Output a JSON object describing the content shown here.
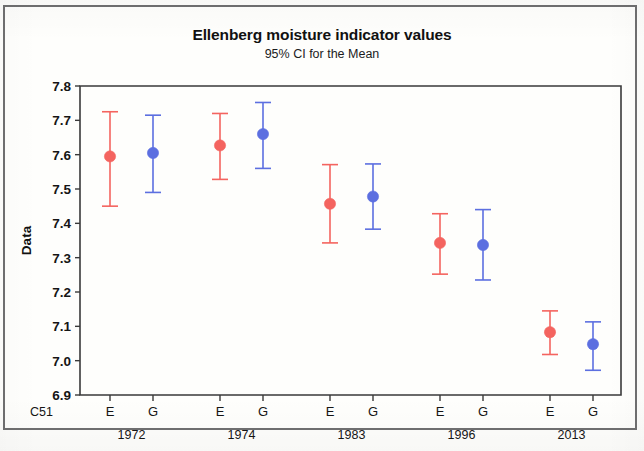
{
  "chart_data": {
    "type": "scatter",
    "title": "Ellenberg moisture indicator values",
    "subtitle": "95% CI for the Mean",
    "ylabel": "Data",
    "xlabel": "",
    "corner_label": "C51",
    "ylim": [
      6.9,
      7.8
    ],
    "ytick_labels": [
      "7.8",
      "7.7",
      "7.6",
      "7.5",
      "7.4",
      "7.3",
      "7.2",
      "7.1",
      "7.0",
      "6.9"
    ],
    "ytick_values": [
      7.8,
      7.7,
      7.6,
      7.5,
      7.4,
      7.3,
      7.2,
      7.1,
      7.0,
      6.9
    ],
    "grid": false,
    "legend": "none",
    "categories": [
      "1972",
      "1974",
      "1983",
      "1996",
      "2013"
    ],
    "subcategories": [
      "E",
      "G"
    ],
    "colors": {
      "E": "#F4645F",
      "G": "#5C6FE0"
    },
    "series": [
      {
        "name": "E",
        "color": "#F4645F",
        "values": [
          7.595,
          7.627,
          7.457,
          7.343,
          7.083
        ],
        "ci_lower": [
          7.45,
          7.528,
          7.343,
          7.252,
          7.018
        ],
        "ci_upper": [
          7.725,
          7.72,
          7.571,
          7.428,
          7.145
        ]
      },
      {
        "name": "G",
        "color": "#5C6FE0",
        "values": [
          7.605,
          7.66,
          7.478,
          7.337,
          7.048
        ],
        "ci_lower": [
          7.49,
          7.56,
          7.383,
          7.235,
          6.972
        ],
        "ci_upper": [
          7.715,
          7.752,
          7.573,
          7.44,
          7.113
        ]
      }
    ],
    "points": [
      {
        "group": "1972",
        "sub": "E",
        "mean": 7.595,
        "lower": 7.45,
        "upper": 7.725,
        "color": "#F4645F"
      },
      {
        "group": "1972",
        "sub": "G",
        "mean": 7.605,
        "lower": 7.49,
        "upper": 7.715,
        "color": "#5C6FE0"
      },
      {
        "group": "1974",
        "sub": "E",
        "mean": 7.627,
        "lower": 7.528,
        "upper": 7.72,
        "color": "#F4645F"
      },
      {
        "group": "1974",
        "sub": "G",
        "mean": 7.66,
        "lower": 7.56,
        "upper": 7.752,
        "color": "#5C6FE0"
      },
      {
        "group": "1983",
        "sub": "E",
        "mean": 7.457,
        "lower": 7.343,
        "upper": 7.571,
        "color": "#F4645F"
      },
      {
        "group": "1983",
        "sub": "G",
        "mean": 7.478,
        "lower": 7.383,
        "upper": 7.573,
        "color": "#5C6FE0"
      },
      {
        "group": "1996",
        "sub": "E",
        "mean": 7.343,
        "lower": 7.252,
        "upper": 7.428,
        "color": "#F4645F"
      },
      {
        "group": "1996",
        "sub": "G",
        "mean": 7.337,
        "lower": 7.235,
        "upper": 7.44,
        "color": "#5C6FE0"
      },
      {
        "group": "2013",
        "sub": "E",
        "mean": 7.083,
        "lower": 7.018,
        "upper": 7.145,
        "color": "#F4645F"
      },
      {
        "group": "2013",
        "sub": "G",
        "mean": 7.048,
        "lower": 6.972,
        "upper": 7.113,
        "color": "#5C6FE0"
      }
    ]
  }
}
